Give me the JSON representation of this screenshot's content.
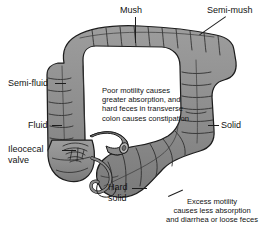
{
  "figure": {
    "background_color": "#ffffff",
    "organ_fill_color": "#8c8c8c",
    "organ_outline_color": "#1d1d1d",
    "text_color": "#121212"
  },
  "labels": [
    {
      "id": "mush",
      "text": "Mush"
    },
    {
      "id": "semi_mush",
      "text": "Semi-mush"
    },
    {
      "id": "semi_fluid",
      "text": "Semi-fluid"
    },
    {
      "id": "fluid",
      "text": "Fluid"
    },
    {
      "id": "solid",
      "text": "Solid"
    },
    {
      "id": "ileocecal",
      "text": "Ileocecal\nvalve"
    },
    {
      "id": "hard_solid",
      "text": "Hard\nsolid"
    }
  ],
  "notes": [
    {
      "id": "poor_motility",
      "text": "Poor motility causes\ngreater absorption, and\nhard feces in transverse\ncolon causes constipation"
    },
    {
      "id": "excess_motility",
      "text": "Excess motility\ncauses less absorption\nand diarrhea or loose feces"
    }
  ]
}
